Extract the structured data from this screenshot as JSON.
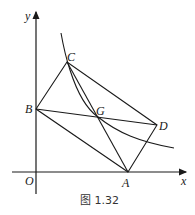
{
  "figure": {
    "caption": "图 1.32",
    "axes": {
      "x_label": "x",
      "y_label": "y",
      "origin_label": "O"
    },
    "points": {
      "A": {
        "label": "A"
      },
      "B": {
        "label": "B"
      },
      "C": {
        "label": "C"
      },
      "D": {
        "label": "D"
      },
      "G": {
        "label": "G"
      }
    },
    "segments": [
      "AB",
      "BC",
      "CD",
      "DA",
      "BD",
      "CA"
    ],
    "curve": "hyperbola-like curve through C and G",
    "colors": {
      "stroke": "#1a1a1a",
      "background": "#ffffff"
    }
  }
}
